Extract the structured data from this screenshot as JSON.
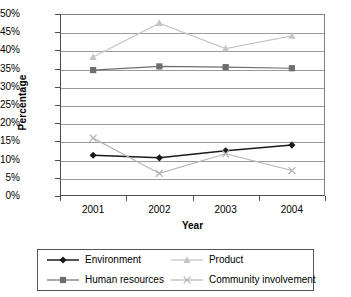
{
  "chart_data": {
    "type": "line",
    "title": "",
    "xlabel": "Year",
    "ylabel": "Percentage",
    "categories": [
      "2001",
      "2002",
      "2003",
      "2004"
    ],
    "ylim": [
      0,
      50
    ],
    "ytick_step": 5,
    "ytick_labels": [
      "0%",
      "5%",
      "10%",
      "15%",
      "20%",
      "25%",
      "30%",
      "35%",
      "40%",
      "45%",
      "50%"
    ],
    "grid": true,
    "legend_position": "bottom",
    "series": [
      {
        "name": "Environment",
        "marker": "diamond",
        "color": "#1a1a1a",
        "values": [
          11.2,
          10.5,
          12.4,
          14.0
        ]
      },
      {
        "name": "Product",
        "marker": "triangle",
        "color": "#c4c4c4",
        "values": [
          38.2,
          47.5,
          40.5,
          44.0
        ]
      },
      {
        "name": "Human resources",
        "marker": "square",
        "color": "#6e6e6e",
        "values": [
          34.6,
          35.6,
          35.4,
          35.1
        ]
      },
      {
        "name": "Community involvement",
        "marker": "cross",
        "color": "#b5b5b5",
        "values": [
          15.9,
          6.2,
          11.6,
          7.0
        ]
      }
    ]
  },
  "legend": {
    "items": [
      {
        "label": "Environment"
      },
      {
        "label": "Product"
      },
      {
        "label": "Human resources"
      },
      {
        "label": "Community involvement"
      }
    ]
  },
  "colors": {
    "axis": "#4d4d4d",
    "grid": "#9a9a9a",
    "background": "#ffffff"
  }
}
